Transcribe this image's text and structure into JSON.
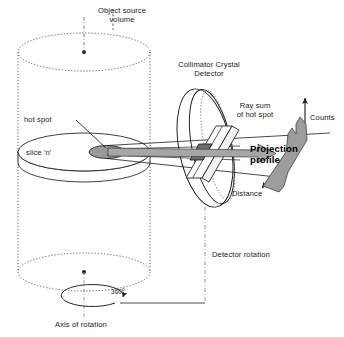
{
  "figure": {
    "title_semantic": "spect-acquisition-geometry-diagram",
    "type": "technical-line-diagram"
  },
  "labels": {
    "object_source_volume": "Object source\nvolume",
    "collimator_crystal_detector": "Collimator Crystal\nDetector",
    "ray_sum_of_hot_spot": "Ray sum\nof hot spot",
    "counts": "Counts",
    "hot_spot": "hot spot",
    "slice_n": "slice 'n'",
    "projection_profile": "Projection\nprofile",
    "distance": "Distance",
    "detector_rotation": "Detector rotation",
    "rotation_degrees": "360",
    "rotation_degree_symbol": "o",
    "axis_of_rotation": "Axis of rotation"
  },
  "colors": {
    "line": "#1a1a1a",
    "hot_spot_fill": "#9a9a9a",
    "profile_fill": "#9d9d9d",
    "ray_arrow_fill": "#a6a6a6",
    "slab_fill": "#ffffff",
    "slab_core_fill": "#6e6e6e",
    "background": "#ffffff",
    "dotted": "#4d4d4d"
  },
  "elements": {
    "cylinder": {
      "name": "object-source-volume-cylinder",
      "top_ellipse": "dotted",
      "bottom_ellipse": "dotted",
      "side_walls": "dotted",
      "center_dots": 2
    },
    "slice": {
      "name": "slice-disc",
      "style": "solid-outline-disc"
    },
    "hot_spot_marker": {
      "name": "hot-spot-ellipse",
      "style": "gray-filled-ellipse"
    },
    "detector_ring": {
      "name": "detector-ring",
      "style": "tilted-ellipse-ring-with-dotted-inner"
    },
    "detector_slab": {
      "name": "detector-crystal-slab",
      "style": "parallelogram"
    },
    "ray_arrow": {
      "name": "ray-sum-arrow",
      "style": "thick-gray-block-arrow"
    },
    "profile_curve": {
      "name": "projection-profile-shape",
      "style": "gray-filled-peak-shape"
    },
    "counts_axis": {
      "name": "counts-axis-arrow",
      "direction": "up"
    },
    "distance_axis": {
      "name": "distance-axis-arrow",
      "direction": "down-left-diagonal"
    },
    "rotation_ellipse": {
      "name": "rotation-direction-ellipse",
      "style": "solid-ellipse-with-arrowhead"
    },
    "axis_line": {
      "name": "axis-of-rotation-line",
      "style": "dash-dot-vertical"
    },
    "detector_rotation_line": {
      "name": "detector-rotation-line",
      "style": "dash-dot-vertical-with-horizontal-link"
    }
  }
}
